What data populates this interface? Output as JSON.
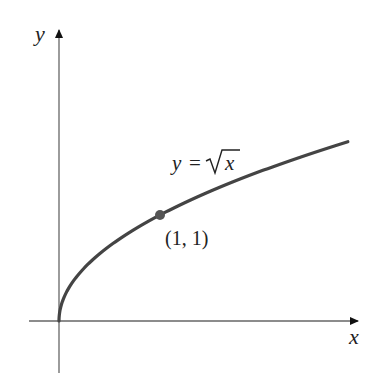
{
  "chart_data": {
    "type": "line",
    "title": "",
    "xlabel": "x",
    "ylabel": "y",
    "series": [
      {
        "name": "y = √x",
        "function": "sqrt(x)",
        "x": [
          0,
          0.25,
          0.5,
          1,
          1.5,
          2,
          2.5,
          2.86
        ],
        "values": [
          0,
          0.5,
          0.707,
          1,
          1.225,
          1.414,
          1.581,
          1.691
        ]
      }
    ],
    "annotations": [
      {
        "text": "(1, 1)",
        "point": [
          1,
          1
        ],
        "marker": "dot"
      },
      {
        "text": "y = √x",
        "type": "curve-label"
      }
    ],
    "grid": false,
    "legend": "none",
    "xlim": [
      -0.3,
      2.95
    ],
    "ylim": [
      -0.5,
      2.75
    ]
  },
  "labels": {
    "x_axis": "x",
    "y_axis": "y",
    "curve_eq_lhs": "y =",
    "curve_eq_rad": "x",
    "point": "(1, 1)"
  },
  "colors": {
    "axis": "#555555",
    "curve": "#444444",
    "marker": "#555555"
  }
}
